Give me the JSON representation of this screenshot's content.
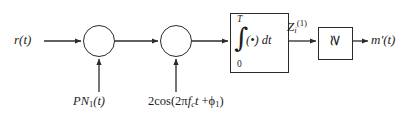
{
  "diagram": {
    "stroke_color": "#2b2b2b",
    "text_color": "#1d1d1d",
    "background_color": "#ffffff",
    "nodes": {
      "input_signal": {
        "label": "r(t)",
        "base": "r",
        "arg": "(t)"
      },
      "output_signal": {
        "label": "m'(t)",
        "base": "m'",
        "arg": "(t)"
      },
      "despread_code": {
        "label": "PN1(t)",
        "base": "PN",
        "subscript": "1",
        "arg": "(t)"
      },
      "carrier_reference": {
        "label": "2cos(2πfct +ϕ1)",
        "prefix": "2cos(2π",
        "f_base": "f",
        "f_sub": "c",
        "t_var": "t",
        "plus": " +",
        "phi": "ϕ",
        "phi_sub": "1",
        "close": ")"
      },
      "decision_variable": {
        "label": "Zi(1)",
        "base": "Z",
        "subscript": "i",
        "superscript": "(1)"
      },
      "integrator": {
        "upper_limit": "T",
        "lower_limit": "0",
        "integral_sign": "∫",
        "integrand": "(•) dt"
      },
      "comparator": {
        "symbol": "≳",
        "name": "threshold-comparator"
      },
      "mixer_1": {
        "name": "despreading-multiplier",
        "symbol": "⊗"
      },
      "mixer_2": {
        "name": "downconversion-multiplier",
        "symbol": "⊗"
      }
    }
  }
}
